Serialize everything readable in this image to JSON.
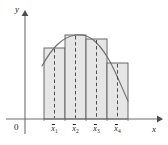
{
  "figure": {
    "axes": {
      "y_label": "y",
      "x_label": "x",
      "origin_label": "0",
      "axis_color": "#6e6e6e",
      "x_axis_y": 119,
      "y_axis_x": 25,
      "x_axis_start": 6,
      "x_axis_end": 161,
      "y_axis_top": 12,
      "y_axis_bottom": 134
    },
    "style": {
      "bar_fill": "#e6e6e6",
      "bar_stroke": "#5a5a5a",
      "curve_color": "#6a6a6a",
      "dash_color": "#3a3a3a",
      "text_color": "#1a1a1a"
    },
    "bars": [
      {
        "label_html": "x&#772;<sub>1</sub>",
        "x_left": 44,
        "x_right": 65,
        "top": 48,
        "midpoint_x": 54.5
      },
      {
        "label_html": "x&#772;<sub>2</sub>",
        "x_left": 65,
        "x_right": 86,
        "top": 35,
        "midpoint_x": 75.5
      },
      {
        "label_html": "x&#772;<sub>3</sub>",
        "x_left": 86,
        "x_right": 107,
        "top": 39,
        "midpoint_x": 96.5
      },
      {
        "label_html": "x&#772;<sub>4</sub>",
        "x_left": 107,
        "x_right": 128,
        "top": 63,
        "midpoint_x": 117.5
      }
    ],
    "tick_labels": [
      {
        "text": "x̄1",
        "x": 54.5,
        "y": 124
      },
      {
        "text": "x̄2",
        "x": 75.5,
        "y": 124
      },
      {
        "text": "x̄3",
        "x": 96.5,
        "y": 124
      },
      {
        "text": "x̄4",
        "x": 117.5,
        "y": 124
      }
    ],
    "curve": {
      "description": "smooth concave-down curve crossing each rectangle top at its midpoint",
      "path": "M 42,66 C 52,48 62,37 75.5,35 C 89,33 98,42 108,58 C 116,72 122,88 128,101"
    }
  }
}
